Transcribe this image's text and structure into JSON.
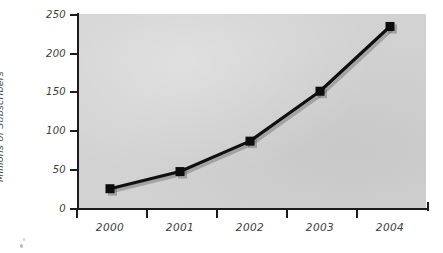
{
  "chart_data": {
    "type": "line",
    "title": "",
    "xlabel": "",
    "ylabel": "Millions of Subscribers",
    "categories": [
      "2000",
      "2001",
      "2002",
      "2003",
      "2004"
    ],
    "values": [
      26,
      48,
      87,
      151,
      234
    ],
    "series": [
      {
        "name": "Millions of Subscribers",
        "values": [
          26,
          48,
          87,
          151,
          234
        ]
      }
    ],
    "ylim": [
      0,
      250
    ],
    "yticks": [
      "0",
      "50",
      "100",
      "150",
      "200",
      "250"
    ],
    "ytick_values": [
      0,
      50,
      100,
      150,
      200,
      250
    ],
    "xticks": [
      "2000",
      "2001",
      "2002",
      "2003",
      "2004"
    ],
    "grid": false,
    "legend": "none",
    "marker_style": "filled-square",
    "line_color": "#101010",
    "plot_background": "#d2d2d2",
    "page_background": "#ffffff",
    "axis_color": "#1c1c1c",
    "label_color": "#3d3d3d"
  }
}
